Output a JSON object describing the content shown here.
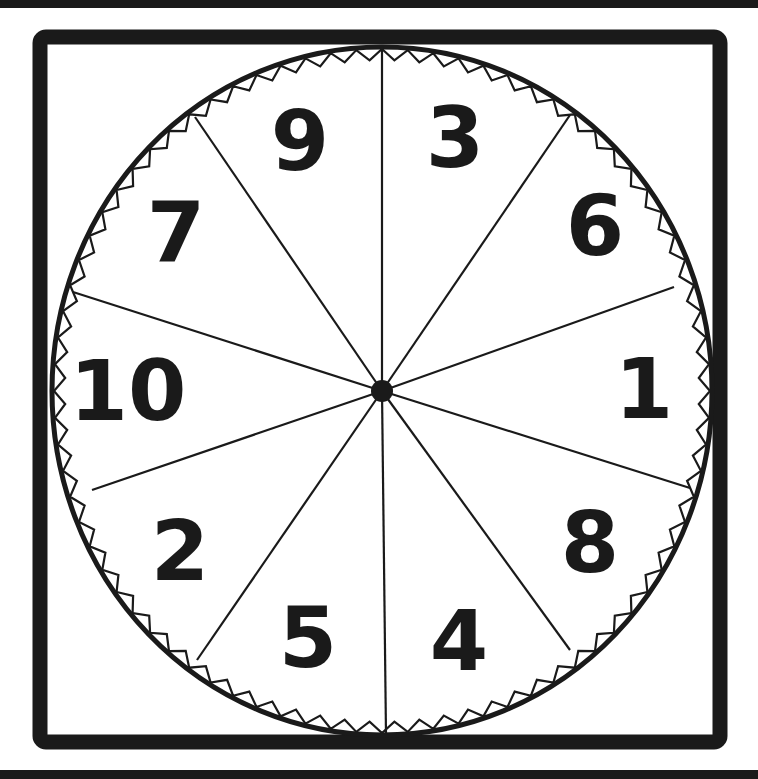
{
  "spinner": {
    "colors": {
      "ink": "#1a1a1a",
      "background": "#ffffff"
    },
    "center": {
      "x": 382,
      "y": 391
    },
    "radius": {
      "x": 330,
      "y": 344
    },
    "dividers": [
      {
        "x": 382,
        "y": 47
      },
      {
        "x": 570,
        "y": 115
      },
      {
        "x": 674,
        "y": 287
      },
      {
        "x": 690,
        "y": 488
      },
      {
        "x": 570,
        "y": 650
      },
      {
        "x": 386,
        "y": 735
      },
      {
        "x": 197,
        "y": 660
      },
      {
        "x": 92,
        "y": 490
      },
      {
        "x": 73,
        "y": 292
      },
      {
        "x": 195,
        "y": 117
      }
    ],
    "sections": [
      {
        "label": "3",
        "x": 455,
        "y": 167
      },
      {
        "label": "6",
        "x": 595,
        "y": 255
      },
      {
        "label": "1",
        "x": 644,
        "y": 418
      },
      {
        "label": "8",
        "x": 590,
        "y": 572
      },
      {
        "label": "4",
        "x": 459,
        "y": 670
      },
      {
        "label": "5",
        "x": 308,
        "y": 667
      },
      {
        "label": "2",
        "x": 180,
        "y": 580
      },
      {
        "label": "10",
        "x": 128,
        "y": 420
      },
      {
        "label": "7",
        "x": 176,
        "y": 262
      },
      {
        "label": "9",
        "x": 300,
        "y": 170
      }
    ]
  }
}
